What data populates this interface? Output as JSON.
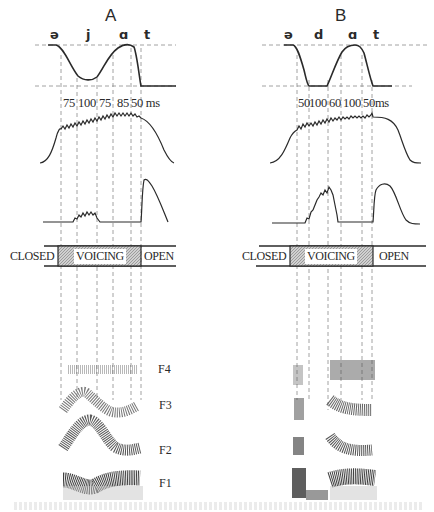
{
  "figure": {
    "panels": [
      {
        "id": "A",
        "title": "A",
        "phonemes": [
          "ə",
          "j",
          "ɑ",
          "t"
        ],
        "durations_ms": [
          "75",
          "100",
          "75",
          "85",
          "50 ms"
        ],
        "glottis": {
          "closed": "CLOSED",
          "voicing": "VOICING",
          "open": "OPEN"
        },
        "formants": [
          "F4",
          "F3",
          "F2",
          "F1"
        ]
      },
      {
        "id": "B",
        "title": "B",
        "phonemes": [
          "ə",
          "d",
          "ɑ",
          "t"
        ],
        "durations_ms": [
          "50",
          "100",
          "60",
          "100",
          "50ms"
        ],
        "glottis": {
          "closed": "CLOSED",
          "voicing": "VOICING",
          "open": "OPEN"
        }
      }
    ],
    "colors": {
      "ink": "#2a2a2a",
      "dashed": "#8a8a8a",
      "voicing_fill": "#b8b8b8",
      "background": "#ffffff"
    }
  }
}
